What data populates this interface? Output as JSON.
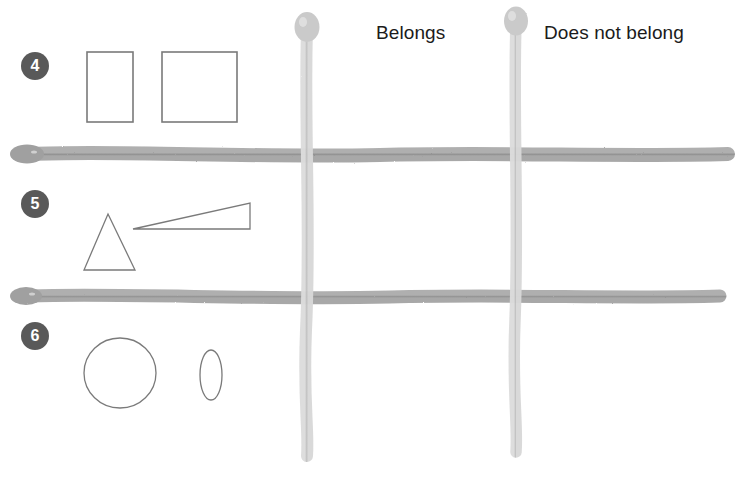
{
  "page": {
    "width": 746,
    "height": 478,
    "background": "#ffffff",
    "kind": "sorting-grid-worksheet"
  },
  "headers": {
    "belongs": "Belongs",
    "does_not_belong": "Does not belong"
  },
  "rows": [
    {
      "badge": "4",
      "shapes": [
        {
          "name": "rectangle-portrait",
          "type": "rect",
          "x": 87,
          "y": 52,
          "width": 46,
          "height": 70
        },
        {
          "name": "square",
          "type": "rect",
          "x": 162,
          "y": 52,
          "width": 75,
          "height": 70
        }
      ]
    },
    {
      "badge": "5",
      "shapes": [
        {
          "name": "triangle-equilateral",
          "type": "triangle",
          "points": "108,214 135,270 84,270"
        },
        {
          "name": "triangle-thin-wedge",
          "type": "triangle",
          "points": "133,229 250,203 250,229"
        }
      ]
    },
    {
      "badge": "6",
      "shapes": [
        {
          "name": "circle",
          "type": "ellipse",
          "cx": 120,
          "cy": 373,
          "rx": 36,
          "ry": 35
        },
        {
          "name": "ellipse-narrow",
          "type": "ellipse",
          "cx": 211,
          "cy": 375,
          "rx": 11,
          "ry": 25
        }
      ]
    }
  ],
  "grid": {
    "vertical_lines": [
      {
        "name": "grid-line-vertical-left",
        "x": 307,
        "top": 12,
        "bottom": 462
      },
      {
        "name": "grid-line-vertical-right",
        "x": 516,
        "top": 8,
        "bottom": 458
      }
    ],
    "horizontal_lines": [
      {
        "name": "grid-line-horizontal-top",
        "y": 154,
        "left": 14,
        "right": 733
      },
      {
        "name": "grid-line-horizontal-bottom",
        "y": 296,
        "left": 12,
        "right": 724
      }
    ]
  },
  "colors": {
    "shape_outline": "#7a7a7a",
    "badge_fill": "#595959",
    "badge_text": "#ffffff",
    "header_text": "#1b1b1b",
    "grid_horizontal": "#9a9a9a",
    "grid_vertical": "#c9c9c9",
    "background": "#ffffff"
  },
  "footer": {
    "faint_artifact_text": ""
  }
}
